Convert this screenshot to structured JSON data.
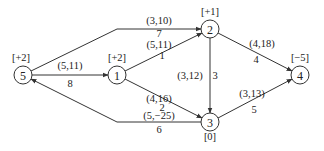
{
  "diagram": {
    "type": "network-flow-graph",
    "nodes": [
      {
        "id": "5",
        "label": "5",
        "supply": "[+2]",
        "x": 23,
        "y": 75,
        "sx": 21,
        "sy": 61
      },
      {
        "id": "1",
        "label": "1",
        "supply": "[+2]",
        "x": 117,
        "y": 75,
        "sx": 117,
        "sy": 61
      },
      {
        "id": "2",
        "label": "2",
        "supply": "[+1]",
        "x": 210,
        "y": 29,
        "sx": 210,
        "sy": 15
      },
      {
        "id": "3",
        "label": "3",
        "supply": "[0]",
        "x": 210,
        "y": 122,
        "sx": 210,
        "sy": 140
      },
      {
        "id": "4",
        "label": "4",
        "supply": "[−5]",
        "x": 300,
        "y": 75,
        "sx": 300,
        "sy": 61
      }
    ],
    "edges": [
      {
        "id": "e7",
        "from": "5",
        "to": "2",
        "params": "(3,10)",
        "index": "7",
        "path": "M31,71 L117,29 L201,29",
        "px": 159,
        "py": 24,
        "ix": 159,
        "iy": 37
      },
      {
        "id": "e8",
        "from": "5",
        "to": "1",
        "params": "(5,11)",
        "index": "8",
        "path": "M32,75 L108,75",
        "px": 70,
        "py": 69,
        "ix": 70,
        "iy": 87
      },
      {
        "id": "e1",
        "from": "1",
        "to": "2",
        "params": "(5,11)",
        "index": "1",
        "path": "M125,71 L202,33",
        "px": 159,
        "py": 48,
        "ix": 162,
        "iy": 59
      },
      {
        "id": "e2",
        "from": "1",
        "to": "3",
        "params": "(4,16)",
        "index": "2",
        "path": "M125,79 L202,118",
        "px": 159,
        "py": 102,
        "ix": 162,
        "iy": 111
      },
      {
        "id": "e3",
        "from": "2",
        "to": "3",
        "params": "(3,12)",
        "index": "3",
        "path": "M210,38 L210,113",
        "px": 190,
        "py": 79,
        "ix": 215,
        "iy": 79
      },
      {
        "id": "e4",
        "from": "2",
        "to": "4",
        "params": "(4,18)",
        "index": "4",
        "path": "M218,33 L292,71",
        "px": 262,
        "py": 47,
        "ix": 256,
        "iy": 63
      },
      {
        "id": "e5",
        "from": "3",
        "to": "4",
        "params": "(3,13)",
        "index": "5",
        "path": "M218,118 L292,79",
        "px": 252,
        "py": 97,
        "ix": 254,
        "iy": 113
      },
      {
        "id": "e6",
        "from": "3",
        "to": "5",
        "params": "(5,−25)",
        "index": "6",
        "path": "M201,122 L117,122 L31,79",
        "px": 159,
        "py": 119,
        "ix": 159,
        "iy": 133
      }
    ]
  }
}
